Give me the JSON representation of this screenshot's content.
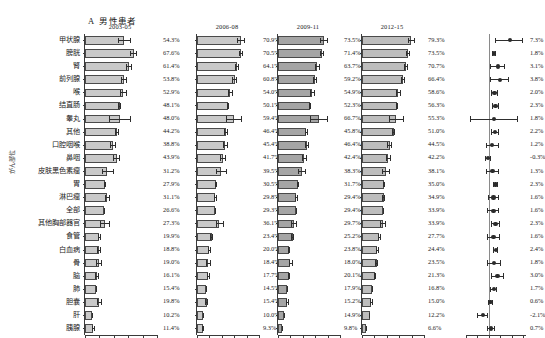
{
  "figure": {
    "panel_letter": "A",
    "title": "男性患者",
    "yaxis_caption": "がん部位"
  },
  "categories": [
    "甲状腺",
    "膀胱",
    "腎",
    "前列腺",
    "喉",
    "结直肠",
    "睾丸",
    "其他",
    "口腔咽喉",
    "鼻咽",
    "皮肤黑色素瘤",
    "胃",
    "淋巴瘤",
    "全部",
    "其他胸部器官",
    "食管",
    "白血病",
    "骨",
    "脑",
    "肺",
    "胆囊",
    "肝",
    "胰腺"
  ],
  "panels": [
    {
      "period": "2003-05",
      "labels": [
        "54.3%",
        "67.6%",
        "61.4%",
        "53.8%",
        "52.9%",
        "48.1%",
        "48.0%",
        "44.2%",
        "38.8%",
        "43.9%",
        "31.2%",
        "27.9%",
        "31.1%",
        "26.6%",
        "27.3%",
        "19.9%",
        "18.8%",
        "19.0%",
        "16.1%",
        "15.4%",
        "19.8%",
        "10.2%",
        "11.4%"
      ],
      "values": [
        54.3,
        67.6,
        61.4,
        53.8,
        52.9,
        48.1,
        48.0,
        44.2,
        38.8,
        43.9,
        31.2,
        27.9,
        31.1,
        26.6,
        27.3,
        19.9,
        18.8,
        19.0,
        16.1,
        15.4,
        19.8,
        10.2,
        11.4
      ],
      "ci_low": [
        46.0,
        63.0,
        57.5,
        50.5,
        48.0,
        46.5,
        33.0,
        42.0,
        35.0,
        39.5,
        24.0,
        26.5,
        28.0,
        26.0,
        21.0,
        18.0,
        16.5,
        15.0,
        14.0,
        14.8,
        16.5,
        9.2,
        10.0
      ],
      "ci_high": [
        63.0,
        72.5,
        65.5,
        57.5,
        57.5,
        49.8,
        64.0,
        46.5,
        43.0,
        48.5,
        39.5,
        29.5,
        34.5,
        27.3,
        34.0,
        22.0,
        21.5,
        23.5,
        18.5,
        16.2,
        23.5,
        11.2,
        13.0
      ]
    },
    {
      "period": "2006-08",
      "labels": [
        "70.9%",
        "70.5%",
        "64.1%",
        "60.8%",
        "54.0%",
        "50.1%",
        "59.4%",
        "46.4%",
        "45.4%",
        "41.7%",
        "39.5%",
        "30.5%",
        "29.8%",
        "29.3%",
        "36.1%",
        "23.4%",
        "20.0%",
        "18.4%",
        "17.7%",
        "14.5%",
        "15.4%",
        "10.0%",
        "9.3%"
      ],
      "values": [
        70.9,
        70.5,
        64.1,
        60.8,
        54.0,
        50.1,
        59.4,
        46.4,
        45.4,
        41.7,
        39.5,
        30.5,
        29.8,
        29.3,
        36.1,
        23.4,
        20.0,
        18.4,
        17.7,
        14.5,
        15.4,
        10.0,
        9.3
      ],
      "ci_low": [
        64.0,
        67.0,
        60.5,
        57.0,
        49.5,
        48.5,
        47.0,
        44.0,
        41.5,
        37.5,
        31.0,
        29.0,
        27.0,
        28.6,
        30.0,
        21.0,
        17.5,
        15.0,
        15.5,
        13.8,
        13.0,
        9.0,
        8.2
      ],
      "ci_high": [
        77.5,
        74.0,
        68.0,
        64.5,
        58.5,
        51.8,
        72.0,
        49.0,
        49.5,
        46.0,
        48.0,
        32.0,
        32.5,
        30.0,
        42.5,
        26.0,
        22.5,
        22.0,
        20.0,
        15.3,
        18.0,
        11.0,
        10.4
      ]
    },
    {
      "period": "2009-11",
      "labels": [
        "73.5%",
        "71.4%",
        "63.7%",
        "59.2%",
        "54.9%",
        "52.3%",
        "66.7%",
        "45.8%",
        "46.4%",
        "42.4%",
        "38.3%",
        "31.7%",
        "29.4%",
        "29.4%",
        "29.7%",
        "25.2%",
        "23.8%",
        "18.0%",
        "20.1%",
        "17.9%",
        "15.2%",
        "14.9%",
        "9.8%",
        "7.1%"
      ],
      "values": [
        73.5,
        71.4,
        63.7,
        59.2,
        54.9,
        52.3,
        66.7,
        45.8,
        46.4,
        42.4,
        38.3,
        31.7,
        29.4,
        29.7,
        25.2,
        23.8,
        18.0,
        20.1,
        17.9,
        15.2,
        14.9,
        9.8,
        7.1
      ],
      "ci_low": [
        67.0,
        68.0,
        60.0,
        56.0,
        51.0,
        50.8,
        52.0,
        43.5,
        43.0,
        38.5,
        32.0,
        30.2,
        27.0,
        29.0,
        20.5,
        21.5,
        16.5,
        17.0,
        16.0,
        14.5,
        12.5,
        9.0,
        6.3
      ],
      "ci_high": [
        80.0,
        74.5,
        67.5,
        62.5,
        59.0,
        53.6,
        81.0,
        48.0,
        50.0,
        46.5,
        44.5,
        33.2,
        31.8,
        30.4,
        30.0,
        26.0,
        19.5,
        23.5,
        19.8,
        16.0,
        17.5,
        10.6,
        8.0
      ]
    },
    {
      "period": "2012-15",
      "labels": [
        "79.3%",
        "73.5%",
        "70.7%",
        "66.4%",
        "58.6%",
        "56.3%",
        "55.3%",
        "51.0%",
        "44.5%",
        "42.2%",
        "38.1%",
        "35.0%",
        "34.9%",
        "33.9%",
        "33.9%",
        "27.7%",
        "24.4%",
        "23.5%",
        "21.3%",
        "16.8%",
        "15.0%",
        "12.2%",
        "6.6%"
      ],
      "values": [
        79.3,
        73.5,
        70.7,
        66.4,
        58.6,
        56.3,
        55.3,
        51.0,
        44.5,
        42.2,
        38.1,
        35.0,
        34.9,
        33.9,
        33.9,
        27.7,
        24.4,
        23.5,
        21.3,
        16.8,
        15.0,
        12.2,
        6.6
      ],
      "ci_low": [
        73.5,
        70.5,
        67.5,
        63.5,
        55.0,
        55.0,
        44.0,
        49.0,
        41.0,
        38.5,
        32.0,
        33.5,
        33.0,
        33.2,
        29.0,
        25.5,
        22.0,
        21.0,
        19.5,
        16.1,
        13.0,
        11.3,
        5.9
      ],
      "ci_high": [
        85.0,
        76.5,
        74.0,
        69.5,
        62.5,
        57.6,
        67.0,
        53.0,
        48.0,
        46.0,
        44.5,
        36.5,
        37.0,
        34.6,
        39.0,
        30.0,
        27.0,
        26.0,
        23.0,
        17.5,
        17.0,
        13.1,
        7.3
      ]
    }
  ],
  "trend": {
    "labels": [
      "7.3%",
      "1.8%",
      "3.1%",
      "3.8%",
      "2.0%",
      "2.3%",
      "1.8%",
      "2.2%",
      "1.2%",
      "-0.3%",
      "1.3%",
      "2.3%",
      "1.6%",
      "1.6%",
      "2.3%",
      "1.6%",
      "2.4%",
      "1.8%",
      "3.0%",
      "1.7%",
      "0.6%",
      "-2.1%",
      "0.7%",
      "-1.5%"
    ],
    "values": [
      7.3,
      1.8,
      3.1,
      3.8,
      2.0,
      2.3,
      1.8,
      2.2,
      1.2,
      -0.3,
      1.3,
      2.3,
      1.6,
      1.6,
      2.3,
      1.6,
      2.4,
      1.8,
      3.0,
      1.7,
      0.6,
      -2.1,
      0.7,
      -1.5
    ],
    "ci_low": [
      2.0,
      1.0,
      0.5,
      0.4,
      0.9,
      1.0,
      -6.5,
      0.8,
      -1.0,
      -1.4,
      -0.9,
      1.5,
      -0.3,
      -0.5,
      0.6,
      -0.5,
      1.5,
      -0.5,
      0.7,
      0.5,
      -0.2,
      -4.0,
      -0.6,
      -2.3
    ],
    "ci_high": [
      12.0,
      2.6,
      5.6,
      7.0,
      3.1,
      3.6,
      10.2,
      3.6,
      3.4,
      0.8,
      3.5,
      3.1,
      3.5,
      3.6,
      4.0,
      3.7,
      3.3,
      4.1,
      5.3,
      2.9,
      1.4,
      -0.2,
      2.0,
      -0.7
    ]
  },
  "axis": {
    "bar_max": 100,
    "bar_ticks": [
      0,
      20,
      40,
      60,
      80,
      100
    ],
    "trend_min": -8,
    "trend_max": 13,
    "trend_ticks": [
      -8,
      -4,
      0,
      4,
      8,
      12
    ]
  },
  "colors": {
    "bar_light": "#c9c9c9",
    "bar_dark": "#a5a5a5",
    "bar_medium": "#bdbdbd",
    "outline": "#4a4a4a",
    "axis": "#3a3a3a",
    "marker": "#2b2b2b"
  }
}
